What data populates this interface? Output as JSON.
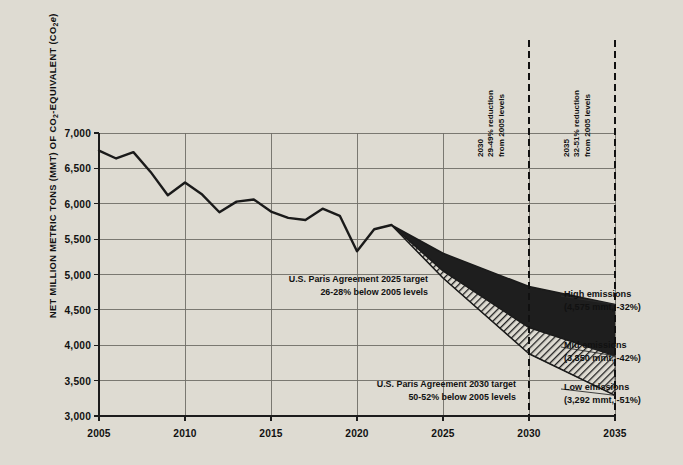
{
  "chart_data": {
    "type": "area",
    "title": "",
    "xlabel": "",
    "ylabel": "NET MILLION METRIC TONS (MMT) OF CO2-EQUIVALENT (CO2e)",
    "ylabel_parts": {
      "lead": "NET MILLION METRIC TONS (MMT) OF CO",
      "sub1": "2",
      "mid": "-EQUIVALENT (CO",
      "sub2": "2",
      "tail_italic": "e",
      "close": ")"
    },
    "xlim": [
      2005,
      2035
    ],
    "ylim": [
      3000,
      7000
    ],
    "grid": true,
    "legend_position": "right-inline",
    "yticks": [
      "3,000",
      "3,500",
      "4,000",
      "4,500",
      "5,000",
      "5,500",
      "6,000",
      "6,500",
      "7,000"
    ],
    "ytick_values": [
      3000,
      3500,
      4000,
      4500,
      5000,
      5500,
      6000,
      6500,
      7000
    ],
    "xticks": [
      "2005",
      "2010",
      "2015",
      "2020",
      "2025",
      "2030",
      "2035"
    ],
    "xtick_values": [
      2005,
      2010,
      2015,
      2020,
      2025,
      2030,
      2035
    ],
    "historical": {
      "name": "Historical net emissions",
      "x": [
        2005,
        2006,
        2007,
        2008,
        2009,
        2010,
        2011,
        2012,
        2013,
        2014,
        2015,
        2016,
        2017,
        2018,
        2019,
        2020,
        2021,
        2022
      ],
      "values": [
        6750,
        6640,
        6730,
        6450,
        6120,
        6300,
        6130,
        5880,
        6030,
        6060,
        5890,
        5800,
        5770,
        5930,
        5830,
        5330,
        5640,
        5700
      ]
    },
    "series": [
      {
        "name": "High emissions",
        "label": "High emissions",
        "annotation": "(4,575 mmt, -32%)",
        "value_2035": 4575,
        "percent_2035": -32,
        "x": [
          2022,
          2025,
          2030,
          2035
        ],
        "values": [
          5700,
          5300,
          4830,
          4575
        ]
      },
      {
        "name": "Mid emissions",
        "label": "Mid emissions",
        "annotation": "(3,850 mmt, -42%)",
        "value_2035": 3850,
        "percent_2035": -42,
        "x": [
          2022,
          2025,
          2030,
          2035
        ],
        "values": [
          5700,
          5050,
          4250,
          3850
        ]
      },
      {
        "name": "Low emissions",
        "label": "Low emissions",
        "annotation": "(3,292 mmt, -51%)",
        "value_2035": 3292,
        "percent_2035": -51,
        "x": [
          2022,
          2025,
          2030,
          2035
        ],
        "values": [
          5700,
          4950,
          3880,
          3292
        ]
      }
    ],
    "markers": [
      {
        "x": 2030,
        "year": "2030",
        "line1": "29-49% reduction",
        "line2": "from 2005 levels"
      },
      {
        "x": 2035,
        "year": "2035",
        "line1": "32-51% reduction",
        "line2": "from 2005 levels"
      }
    ],
    "annotations": [
      {
        "name": "paris-2025-target",
        "line1": "U.S. Paris Agreement 2025 target",
        "line2": "26-28% below 2005 levels"
      },
      {
        "name": "paris-2030-target",
        "line1": "U.S. Paris Agreement 2030 target",
        "line2": "50-52% below 2005 levels"
      }
    ],
    "colors": {
      "background": "#dedbd2",
      "plot_background": "#dedbd2",
      "grid": "#6f6d66",
      "axis": "#1c1c1c",
      "line": "#1a1a1a",
      "band_high": "#1e1e1e",
      "band_low_hatch": "#2a2a2a",
      "marker_line": "#111111"
    }
  }
}
